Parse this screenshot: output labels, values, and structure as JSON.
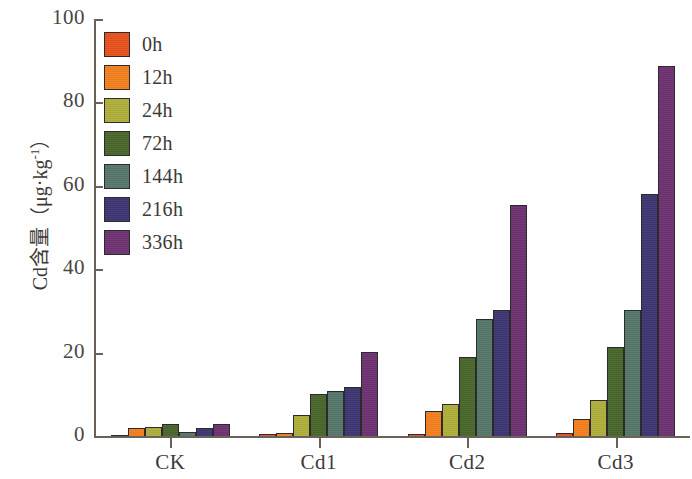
{
  "chart_data": {
    "type": "bar",
    "title": "",
    "subtitle": "",
    "xlabel": "",
    "ylabel": "Cd含量（μg·kg⁻¹）",
    "ylabel_text": "Cd含量（μg·kg",
    "ylabel_sup": "-1",
    "ylabel_tail": "）",
    "categories": [
      "CK",
      "Cd1",
      "Cd2",
      "Cd3"
    ],
    "ylim": [
      0,
      100
    ],
    "yticks": [
      0,
      20,
      40,
      60,
      80,
      100
    ],
    "ytick_labels": [
      "0",
      "20",
      "40",
      "60",
      "80",
      "100"
    ],
    "grid": false,
    "legend_position": "upper-left",
    "series": [
      {
        "name": "0h",
        "color": "#E8521E",
        "values": [
          0.6,
          0.7,
          0.8,
          0.9
        ]
      },
      {
        "name": "12h",
        "color": "#F4801F",
        "values": [
          2.1,
          1.0,
          6.3,
          4.3
        ]
      },
      {
        "name": "24h",
        "color": "#AFAF3C",
        "values": [
          2.4,
          5.2,
          8.0,
          8.9
        ]
      },
      {
        "name": "72h",
        "color": "#49682C",
        "values": [
          3.2,
          10.3,
          19.1,
          21.7
        ]
      },
      {
        "name": "144h",
        "color": "#57776B",
        "values": [
          1.2,
          11.1,
          28.4,
          30.5
        ]
      },
      {
        "name": "216h",
        "color": "#3D3673",
        "values": [
          2.2,
          12.1,
          30.4,
          58.3
        ]
      },
      {
        "name": "336h",
        "color": "#6E3372",
        "values": [
          3.2,
          20.4,
          55.6,
          89.0
        ]
      }
    ]
  },
  "axes": {
    "y_title_main": "Cd含量（μg·kg",
    "y_title_sup": "-1",
    "y_title_end": "）"
  }
}
